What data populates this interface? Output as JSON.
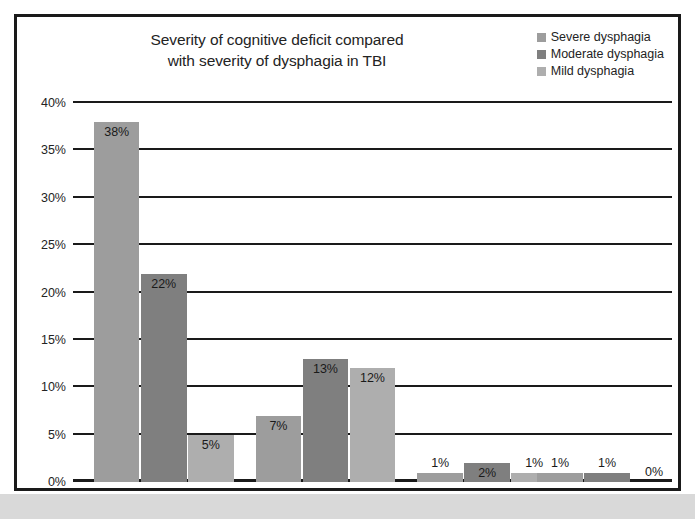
{
  "figure": {
    "title_lines": [
      "Severity of cognitive deficit compared",
      "with severity of dysphagia in TBI"
    ]
  },
  "legend": {
    "items": [
      {
        "label": "Severe dysphagia",
        "color": "#9d9d9d"
      },
      {
        "label": "Moderate dysphagia",
        "color": "#7f7f7f"
      },
      {
        "label": "Mild dysphagia",
        "color": "#aeaeae"
      }
    ]
  },
  "chart_data": {
    "type": "bar",
    "title": "Severity of cognitive deficit compared with severity of dysphagia in TBI",
    "xlabel": "",
    "ylabel": "",
    "ylim": [
      0,
      40
    ],
    "ytick_labels": [
      "0%",
      "5%",
      "10%",
      "15%",
      "20%",
      "25%",
      "30%",
      "35%",
      "40%"
    ],
    "ytick_values": [
      0,
      5,
      10,
      15,
      20,
      25,
      30,
      35,
      40
    ],
    "grid": true,
    "legend_position": "top-right",
    "categories": [
      "",
      "",
      "",
      ""
    ],
    "value_suffix": "%",
    "series": [
      {
        "name": "Severe dysphagia",
        "color": "#9d9d9d",
        "values": [
          38,
          7,
          1,
          1
        ],
        "labels": [
          "38%",
          "7%",
          "1%",
          "1%"
        ]
      },
      {
        "name": "Moderate dysphagia",
        "color": "#7f7f7f",
        "values": [
          22,
          13,
          2,
          1
        ],
        "labels": [
          "22%",
          "13%",
          "2%",
          "1%"
        ]
      },
      {
        "name": "Mild dysphagia",
        "color": "#aeaeae",
        "values": [
          5,
          12,
          1,
          0
        ],
        "labels": [
          "5%",
          "12%",
          "1%",
          "0%"
        ]
      }
    ]
  }
}
